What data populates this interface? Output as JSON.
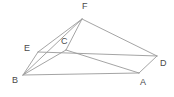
{
  "figure": {
    "background_color": "#ffffff",
    "line_color": "#9a9a9a",
    "label_color": "#4a4a4a",
    "canvas": {
      "width": 174,
      "height": 97
    },
    "vertices": [
      {
        "id": "B",
        "label": "B",
        "x": 23,
        "y": 75,
        "label_x": 12,
        "label_y": 76
      },
      {
        "id": "A",
        "label": "A",
        "x": 139,
        "y": 73,
        "label_x": 140,
        "label_y": 78
      },
      {
        "id": "D",
        "label": "D",
        "x": 157,
        "y": 56,
        "label_x": 160,
        "label_y": 59
      },
      {
        "id": "E",
        "label": "E",
        "x": 38,
        "y": 52,
        "label_x": 24,
        "label_y": 44
      },
      {
        "id": "C",
        "label": "C",
        "x": 66,
        "y": 50,
        "label_x": 61,
        "label_y": 37
      },
      {
        "id": "F",
        "label": "F",
        "x": 82,
        "y": 19,
        "label_x": 82,
        "label_y": 2
      }
    ],
    "edges": [
      {
        "id": "B-A",
        "from": "B",
        "to": "A"
      },
      {
        "id": "B-E",
        "from": "B",
        "to": "E"
      },
      {
        "id": "E-D",
        "from": "E",
        "to": "D"
      },
      {
        "id": "A-D",
        "from": "A",
        "to": "D"
      },
      {
        "id": "B-F",
        "from": "B",
        "to": "F"
      },
      {
        "id": "B-C",
        "from": "B",
        "to": "C"
      },
      {
        "id": "C-F",
        "from": "C",
        "to": "F"
      },
      {
        "id": "E-F",
        "from": "E",
        "to": "F"
      },
      {
        "id": "F-D",
        "from": "F",
        "to": "D"
      },
      {
        "id": "C-A",
        "from": "C",
        "to": "A"
      }
    ]
  }
}
